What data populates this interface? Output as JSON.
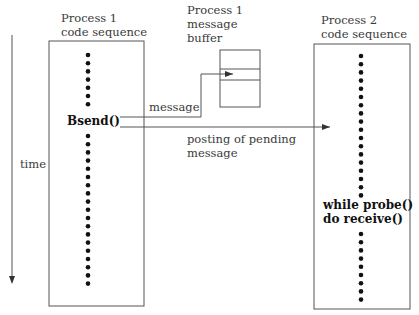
{
  "diagram": {
    "time_axis": {
      "label": "time"
    },
    "process1": {
      "title_line1": "Process 1",
      "title_line2": "code sequence",
      "call": "Bsend()"
    },
    "buffer": {
      "title_line1": "Process 1",
      "title_line2": "message",
      "title_line3": "buffer"
    },
    "process2": {
      "title_line1": "Process 2",
      "title_line2": "code sequence",
      "call_line1": "while probe()",
      "call_line2": "do receive()"
    },
    "arrows": {
      "message": "message",
      "posting_line1": "posting of pending",
      "posting_line2": "message"
    },
    "colors": {
      "line": "#555555",
      "dot": "#111111"
    }
  }
}
